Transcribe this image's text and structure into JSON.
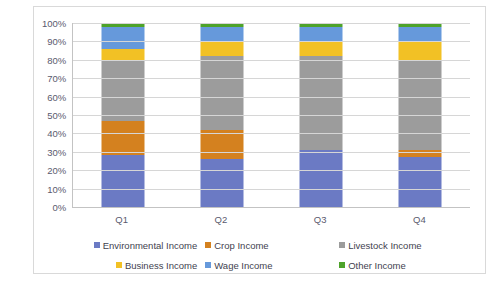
{
  "chart_data": {
    "type": "bar",
    "stacked": "100%",
    "title": "",
    "subtitle": "",
    "xlabel": "",
    "ylabel": "",
    "categories": [
      "Q1",
      "Q2",
      "Q3",
      "Q4"
    ],
    "ylim": [
      0,
      100
    ],
    "ytick_labels": [
      "100%",
      "90%",
      "80%",
      "70%",
      "60%",
      "50%",
      "40%",
      "30%",
      "20%",
      "10%",
      "0%"
    ],
    "ytick_values": [
      100,
      90,
      80,
      70,
      60,
      50,
      40,
      30,
      20,
      10,
      0
    ],
    "grid": true,
    "legend_position": "bottom",
    "series": [
      {
        "name": "Environmental Income",
        "color": "#6b7ac4",
        "values": [
          28,
          26,
          31,
          27
        ]
      },
      {
        "name": "Crop Income",
        "color": "#d4811f",
        "values": [
          19,
          16,
          0,
          4
        ]
      },
      {
        "name": "Livestock Income",
        "color": "#9c9c9c",
        "values": [
          33,
          40,
          51,
          49
        ]
      },
      {
        "name": "Business Income",
        "color": "#f2c125",
        "values": [
          6,
          8,
          8,
          10
        ]
      },
      {
        "name": "Wage Income",
        "color": "#6699db",
        "values": [
          12,
          8,
          8,
          8
        ]
      },
      {
        "name": "Other Income",
        "color": "#4ea32a",
        "values": [
          2,
          2,
          2,
          2
        ]
      }
    ]
  },
  "legend": {
    "rows": [
      [
        {
          "label": "Environmental Income",
          "color": "#6b7ac4",
          "name": "legend-environmental-income"
        },
        {
          "label": "Crop Income",
          "color": "#d4811f",
          "name": "legend-crop-income"
        },
        {
          "label": "Livestock Income",
          "color": "#9c9c9c",
          "name": "legend-livestock-income"
        }
      ],
      [
        {
          "label": "Business Income",
          "color": "#f2c125",
          "name": "legend-business-income"
        },
        {
          "label": "Wage Income",
          "color": "#6699db",
          "name": "legend-wage-income"
        },
        {
          "label": "Other Income",
          "color": "#4ea32a",
          "name": "legend-other-income"
        }
      ]
    ]
  }
}
